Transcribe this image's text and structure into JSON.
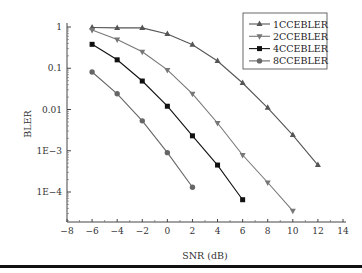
{
  "chart_data": {
    "type": "line",
    "title": "",
    "xlabel": "SNR (dB)",
    "ylabel": "BLER",
    "xlim": [
      -8,
      14
    ],
    "ylim": [
      2e-05,
      1
    ],
    "yscale": "log",
    "grid": false,
    "legend_position": "upper right",
    "x_ticks": [
      -8,
      -6,
      -4,
      -2,
      0,
      2,
      4,
      6,
      8,
      10,
      12,
      14
    ],
    "x_tick_labels": [
      "−8",
      "−6",
      "−4",
      "−2",
      "0",
      "2",
      "4",
      "6",
      "8",
      "10",
      "12",
      "14"
    ],
    "y_ticks": [
      1,
      0.1,
      0.01,
      0.001,
      0.0001
    ],
    "y_tick_labels": [
      "1",
      "0.1",
      "0.01",
      "1E−3",
      "1E−4"
    ],
    "series": [
      {
        "name": "1CCEBLER",
        "marker": "triangle-up",
        "color": "#555555",
        "x": [
          -6,
          -4,
          -2,
          0,
          2,
          4,
          6,
          8,
          10,
          12
        ],
        "values": [
          0.97,
          0.95,
          0.95,
          0.68,
          0.37,
          0.15,
          0.044,
          0.011,
          0.0024,
          0.00045
        ]
      },
      {
        "name": "2CCEBLER",
        "marker": "triangle-down",
        "color": "#777777",
        "x": [
          -6,
          -4,
          -2,
          0,
          2,
          4,
          6,
          8,
          10
        ],
        "values": [
          0.85,
          0.5,
          0.25,
          0.091,
          0.024,
          0.0047,
          0.00079,
          0.00017,
          3.5e-05
        ]
      },
      {
        "name": "4CCEBLER",
        "marker": "square",
        "color": "#111111",
        "x": [
          -6,
          -4,
          -2,
          0,
          2,
          4,
          6
        ],
        "values": [
          0.38,
          0.16,
          0.049,
          0.012,
          0.0023,
          0.00045,
          6.5e-05
        ]
      },
      {
        "name": "8CCEBLER",
        "marker": "circle",
        "color": "#666666",
        "x": [
          -6,
          -4,
          -2,
          0,
          2
        ],
        "values": [
          0.081,
          0.024,
          0.0053,
          0.0009,
          0.00013
        ]
      }
    ]
  }
}
